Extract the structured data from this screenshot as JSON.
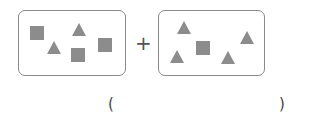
{
  "diagram": {
    "operator": "+",
    "answer_open": "(",
    "answer_close": ")",
    "colors": {
      "shape": "#8c8c8c",
      "border": "#8a8a8a"
    },
    "groups": [
      {
        "name": "left-group",
        "squares": 3,
        "triangles": 2,
        "shapes": [
          {
            "type": "square",
            "x": 30,
            "y": 26
          },
          {
            "type": "triangle",
            "x": 47,
            "y": 41
          },
          {
            "type": "triangle",
            "x": 72,
            "y": 23
          },
          {
            "type": "square",
            "x": 71,
            "y": 48
          },
          {
            "type": "square",
            "x": 98,
            "y": 38
          }
        ]
      },
      {
        "name": "right-group",
        "squares": 1,
        "triangles": 4,
        "shapes": [
          {
            "type": "triangle",
            "x": 177,
            "y": 21
          },
          {
            "type": "square",
            "x": 196,
            "y": 41
          },
          {
            "type": "triangle",
            "x": 240,
            "y": 31
          },
          {
            "type": "triangle",
            "x": 170,
            "y": 50
          },
          {
            "type": "triangle",
            "x": 221,
            "y": 51
          }
        ]
      }
    ]
  }
}
